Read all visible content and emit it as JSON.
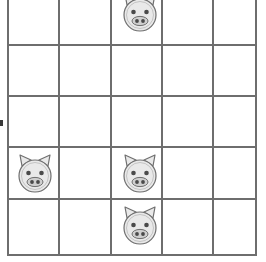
{
  "scene": {
    "title": "Pig grid puzzle board",
    "background_color": "#ffffff"
  },
  "board": {
    "name": "pig-grid",
    "columns": 5,
    "rows": 5,
    "cell_width": 51,
    "cell_height": 52,
    "line_color": "#6e6e6e",
    "line_width": 2,
    "cell_fill": "#ffffff",
    "top_row_clipped": true,
    "column_x": [
      7,
      58,
      110,
      161,
      212,
      257
    ],
    "row_y": [
      -8,
      44,
      95,
      146,
      198,
      256
    ]
  },
  "tokens": {
    "icon_name": "pig-face-icon",
    "body_color": "#e9e9e9",
    "outline_color": "#6f6f6f",
    "eye_color": "#4a4a4a",
    "snout_color": "#cfcfcf",
    "nostril_color": "#4a4a4a",
    "count": 4,
    "items": [
      {
        "label": "pig-r1c3",
        "row": 1,
        "col": 3,
        "x": 118,
        "y": -9,
        "clipped": true
      },
      {
        "label": "pig-r4c1",
        "row": 4,
        "col": 1,
        "x": 13,
        "y": 152,
        "clipped": false
      },
      {
        "label": "pig-r4c3",
        "row": 4,
        "col": 3,
        "x": 118,
        "y": 152,
        "clipped": false
      },
      {
        "label": "pig-r5c3",
        "row": 5,
        "col": 3,
        "x": 118,
        "y": 204,
        "clipped": false
      }
    ]
  },
  "markers": {
    "left_edge_tick": {
      "name": "left-edge-tick",
      "color": "#3a3a3a",
      "x": 0,
      "y": 120,
      "width": 3,
      "height": 6
    }
  }
}
